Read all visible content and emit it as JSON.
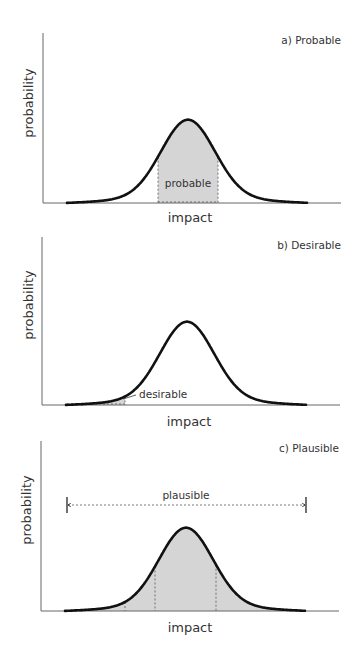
{
  "chart_data": [
    {
      "type": "area",
      "title": "a) Probable",
      "xlabel": "impact",
      "ylabel": "probability",
      "grid": false,
      "legend": null,
      "curve": "bell-shaped probability distribution with long flat tails",
      "shaded_region": {
        "label": "probable",
        "from": 0.38,
        "to": 0.63,
        "style": "central band, dashed vertical borders"
      },
      "annotations": [
        "probable"
      ]
    },
    {
      "type": "area",
      "title": "b) Desirable",
      "xlabel": "impact",
      "ylabel": "probability",
      "grid": false,
      "legend": null,
      "curve": "bell-shaped probability distribution with long flat tails",
      "shaded_region": {
        "label": "desirable",
        "from": 0.0,
        "to": 0.24,
        "style": "left tail, with leader line to label"
      },
      "annotations": [
        "desirable"
      ]
    },
    {
      "type": "area",
      "title": "c) Plausible",
      "xlabel": "impact",
      "ylabel": "probability",
      "grid": false,
      "legend": null,
      "curve": "bell-shaped probability distribution with long flat tails",
      "shaded_region": {
        "label": "plausible",
        "from": 0.0,
        "to": 1.0,
        "style": "entire area under curve, dashed verticals at 0.24, 0.37, 0.62"
      },
      "annotations": [
        "plausible"
      ],
      "range_arrow": {
        "label": "plausible",
        "from": 0.0,
        "to": 1.0
      }
    }
  ],
  "panels": {
    "a": {
      "title": "a) Probable",
      "xlabel": "impact",
      "ylabel": "probability",
      "region_label": "probable"
    },
    "b": {
      "title": "b) Desirable",
      "xlabel": "impact",
      "ylabel": "probability",
      "region_label": "desirable"
    },
    "c": {
      "title": "c) Plausible",
      "xlabel": "impact",
      "ylabel": "probability",
      "region_label": "plausible"
    }
  },
  "colors": {
    "curve": "#111111",
    "axis": "#555555",
    "shade": "#d3d3d3",
    "text": "#333333"
  }
}
